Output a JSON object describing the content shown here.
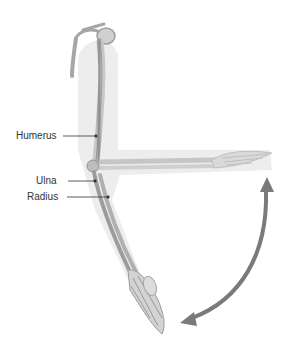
{
  "diagram": {
    "labels": [
      {
        "text": "Humerus"
      },
      {
        "text": "Ulna"
      },
      {
        "text": "Radius"
      }
    ],
    "arrow": {
      "meaning": "range-of-motion-double-arrow",
      "color": "#7a7a7a"
    },
    "bone_color": "#9a9a9a"
  }
}
